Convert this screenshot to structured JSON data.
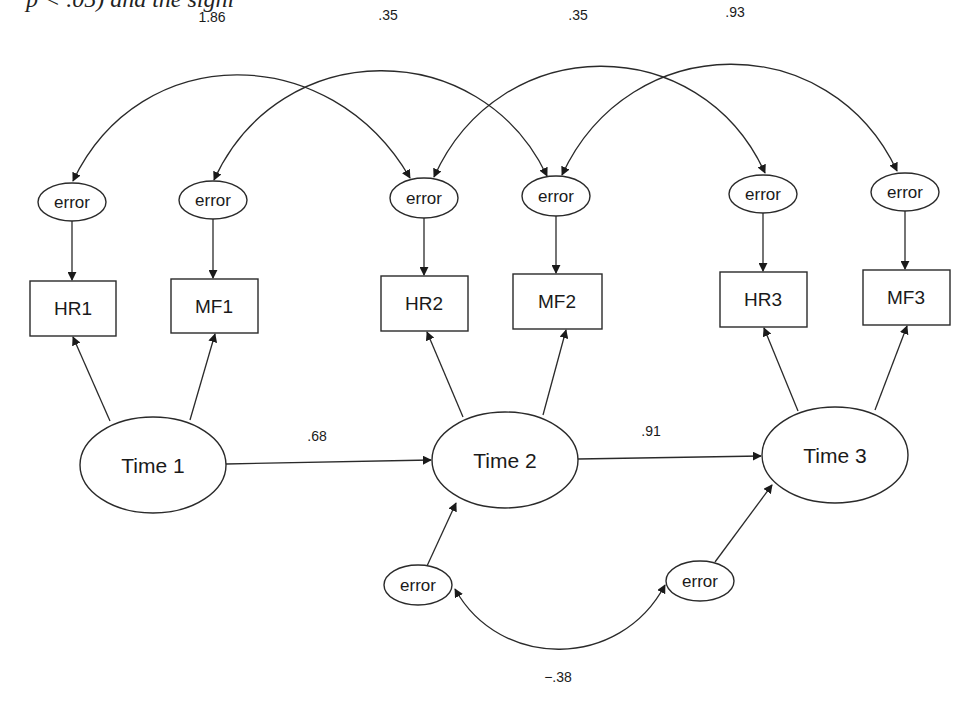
{
  "page": {
    "cropped_top_text": "p < .05) and the signi"
  },
  "diagram": {
    "type": "structural equation model (path diagram)",
    "latent_factors": [
      {
        "id": "t1",
        "label": "Time 1"
      },
      {
        "id": "t2",
        "label": "Time 2"
      },
      {
        "id": "t3",
        "label": "Time 3"
      }
    ],
    "indicators": [
      {
        "id": "hr1",
        "label": "HR1",
        "factor": "Time 1"
      },
      {
        "id": "mf1",
        "label": "MF1",
        "factor": "Time 1"
      },
      {
        "id": "hr2",
        "label": "HR2",
        "factor": "Time 2"
      },
      {
        "id": "mf2",
        "label": "MF2",
        "factor": "Time 2"
      },
      {
        "id": "hr3",
        "label": "HR3",
        "factor": "Time 3"
      },
      {
        "id": "mf3",
        "label": "MF3",
        "factor": "Time 3"
      }
    ],
    "error_label": "error",
    "indicator_errors": [
      {
        "target": "HR1",
        "label": "error"
      },
      {
        "target": "MF1",
        "label": "error"
      },
      {
        "target": "HR2",
        "label": "error"
      },
      {
        "target": "MF2",
        "label": "error"
      },
      {
        "target": "HR3",
        "label": "error"
      },
      {
        "target": "MF3",
        "label": "error"
      }
    ],
    "factor_errors": [
      {
        "target": "Time 2",
        "label": "error"
      },
      {
        "target": "Time 3",
        "label": "error"
      }
    ],
    "paths": [
      {
        "from": "Time 1",
        "to": "Time 2",
        "coefficient": ".68"
      },
      {
        "from": "Time 2",
        "to": "Time 3",
        "coefficient": ".91"
      }
    ],
    "correlated_errors": [
      {
        "between": [
          "error HR1",
          "error HR2"
        ],
        "value": "1.86"
      },
      {
        "between": [
          "error MF1",
          "error MF2"
        ],
        "value": ".35"
      },
      {
        "between": [
          "error HR2",
          "error HR3"
        ],
        "value": ".35"
      },
      {
        "between": [
          "error MF2",
          "error MF3"
        ],
        "value": ".93"
      },
      {
        "between": [
          "error Time 2",
          "error Time 3"
        ],
        "value": "−.38"
      }
    ]
  }
}
